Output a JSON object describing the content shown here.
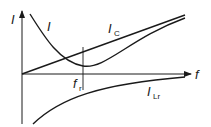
{
  "diagram": {
    "axes": {
      "y_label": "I",
      "x_label": "f"
    },
    "curves": [
      {
        "id": "total-current",
        "label": "I",
        "label_sub": "",
        "shape": "U-shaped, minimum at resonance"
      },
      {
        "id": "capacitor-current",
        "label": "I",
        "label_sub": "C",
        "shape": "straight line rising from origin"
      },
      {
        "id": "inductor-current",
        "label": "I",
        "label_sub": "Lr",
        "shape": "negative branch approaching axis"
      }
    ],
    "markers": [
      {
        "id": "resonant-frequency",
        "label": "f",
        "label_sub": "r"
      }
    ],
    "colors": {
      "stroke": "#1a1a1a",
      "background": "#ffffff"
    }
  }
}
